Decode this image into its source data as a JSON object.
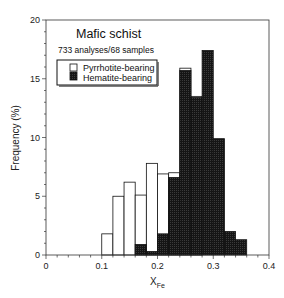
{
  "chart_data": {
    "type": "bar",
    "subtype": "stacked-overlay-histogram",
    "title": "Mafic schist",
    "subtitle": "733 analyses/68 samples",
    "xlabel": "X",
    "xlabel_subscript": "Fe",
    "ylabel": "Frequency (%)",
    "xlim": [
      0,
      0.4
    ],
    "ylim": [
      0,
      20
    ],
    "x_ticks": [
      "0",
      "0.1",
      "0.2",
      "0.3",
      "0.4"
    ],
    "y_ticks": [
      "0",
      "5",
      "10",
      "15",
      "20"
    ],
    "bin_width": 0.02,
    "bins": [
      0.1,
      0.12,
      0.14,
      0.16,
      0.18,
      0.2,
      0.22,
      0.24,
      0.26,
      0.28,
      0.3,
      0.32,
      0.34
    ],
    "series": [
      {
        "name": "Pyrrhotite-bearing",
        "color": "#ffffff",
        "values": [
          1.8,
          5.0,
          6.2,
          5.1,
          7.8,
          6.9,
          7.0,
          15.9,
          13.5,
          0,
          0,
          0,
          0
        ]
      },
      {
        "name": "Hematite-bearing",
        "color": "#111111",
        "values": [
          0,
          0,
          0,
          0.9,
          0.3,
          1.8,
          6.6,
          15.7,
          13.4,
          17.4,
          9.9,
          2.0,
          1.3
        ]
      }
    ],
    "legend_position": "upper-left",
    "grid": false
  }
}
